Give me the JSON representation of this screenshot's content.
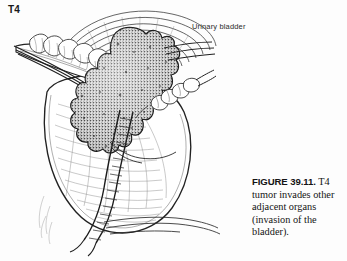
{
  "figure": {
    "stage_label": "T4",
    "organ_label": "Urinary bladder",
    "caption_head": "FIGURE 39.11.",
    "caption_body": " T4 tumor invades other adjacent organs (invasion of the bladder).",
    "background_color": "#fdfdfd",
    "ink_color": "#1a1a1a",
    "tumor_fill": "#4a4a4a",
    "line_color": "#2a2a2a"
  },
  "structures": [
    {
      "name": "sacrum-vertebrae",
      "label": "sacrum"
    },
    {
      "name": "urinary-bladder",
      "label": "urinary bladder"
    },
    {
      "name": "tumor-mass",
      "label": "T4 tumor"
    },
    {
      "name": "rectum",
      "label": "rectum"
    },
    {
      "name": "anal-canal",
      "label": "anal canal"
    },
    {
      "name": "seminal-vesicle",
      "label": "seminal vesicle"
    },
    {
      "name": "peritoneum-arcs",
      "label": "peritoneal reflection"
    }
  ]
}
